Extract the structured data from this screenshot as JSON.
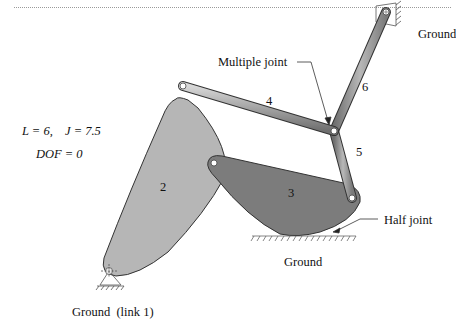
{
  "figure": {
    "type": "planar linkage diagram",
    "equations": {
      "line1_L": "L = 6,",
      "line1_J": "J = 7.5",
      "line2": "DOF = 0"
    },
    "labels": {
      "ground_top_right": "Ground",
      "multiple_joint": "Multiple joint",
      "half_joint": "Half joint",
      "ground_bottom": "Ground",
      "ground_link1": "Ground  (link 1)"
    },
    "link_numbers": {
      "link2": "2",
      "link3": "3",
      "link4": "4",
      "link5": "5",
      "link6": "6"
    },
    "colors": {
      "link2_fill": "#b4b4b4",
      "link3_fill": "#7a7a7a",
      "bar_fill": "#9c9c9c",
      "outline": "#333333"
    }
  }
}
